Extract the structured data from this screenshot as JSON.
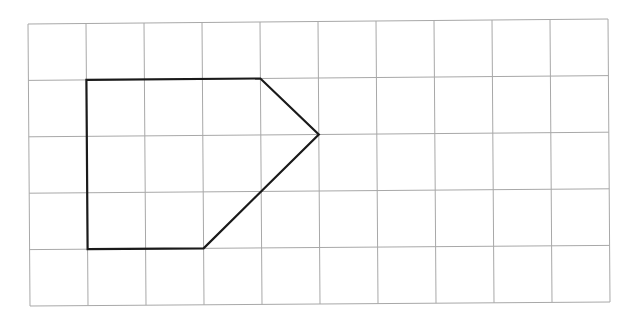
{
  "diagram": {
    "type": "grid-polygon",
    "grid": {
      "columns": 10,
      "rows": 5,
      "line_color": "#a8a8a8",
      "corners_px": {
        "top_left": [
          28,
          24
        ],
        "top_right": [
          608,
          19
        ],
        "bottom_left": [
          30,
          306
        ],
        "bottom_right": [
          610,
          302
        ]
      }
    },
    "shape": {
      "name": "pentagon",
      "stroke_color": "#1a1a1a",
      "vertices_grid": [
        [
          1,
          1
        ],
        [
          4,
          1
        ],
        [
          5,
          2
        ],
        [
          3,
          4
        ],
        [
          1,
          4
        ]
      ]
    }
  }
}
